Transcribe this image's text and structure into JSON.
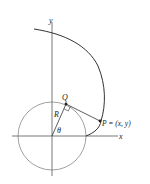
{
  "diagram": {
    "type": "involute-of-circle",
    "labels": {
      "y_axis": "y",
      "x_axis": "x",
      "point_q": "Q",
      "point_p": "P = (x, y)",
      "radius": "R",
      "angle": "θ"
    },
    "colors": {
      "stroke": "#333333",
      "circle": "#777777",
      "text": "#222222"
    }
  }
}
